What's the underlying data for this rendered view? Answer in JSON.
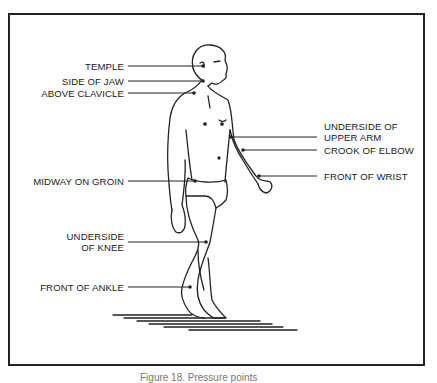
{
  "figure": {
    "caption": "Figure 18. Pressure points",
    "labels_left": [
      {
        "id": "temple",
        "text": "TEMPLE"
      },
      {
        "id": "side-of-jaw",
        "text": "SIDE OF JAW"
      },
      {
        "id": "above-clavicle",
        "text": "ABOVE CLAVICLE"
      },
      {
        "id": "midway-on-groin",
        "text": "MIDWAY ON GROIN"
      },
      {
        "id": "underside-of-knee",
        "line1": "UNDERSIDE",
        "line2": "OF KNEE"
      },
      {
        "id": "front-of-ankle",
        "text": "FRONT OF ANKLE"
      }
    ],
    "labels_right": [
      {
        "id": "underside-of-upper-arm",
        "line1": "UNDERSIDE OF",
        "line2": "UPPER ARM"
      },
      {
        "id": "crook-of-elbow",
        "text": "CROOK OF ELBOW"
      },
      {
        "id": "front-of-wrist",
        "text": "FRONT OF WRIST"
      }
    ]
  }
}
